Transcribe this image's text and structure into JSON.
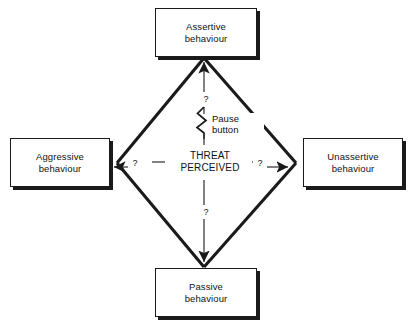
{
  "diagram": {
    "center": {
      "label": "THREAT\nPERCEIVED",
      "line1": "THREAT",
      "line2": "PERCEIVED"
    },
    "pause": {
      "label": "Pause\nbutton",
      "line1": "Pause",
      "line2": "button",
      "icon": "lightning-squiggle-icon"
    },
    "nodes": [
      {
        "id": "assertive",
        "label": "Assertive\nbehaviour",
        "line1": "Assertive",
        "line2": "behaviour",
        "position": "top"
      },
      {
        "id": "aggressive",
        "label": "Aggressive\nbehaviour",
        "line1": "Aggressive",
        "line2": "behaviour",
        "position": "left"
      },
      {
        "id": "unassertive",
        "label": "Unassertive\nbehaviour",
        "line1": "Unassertive",
        "line2": "behaviour",
        "position": "right"
      },
      {
        "id": "passive",
        "label": "Passive\nbehaviour",
        "line1": "Passive",
        "line2": "behaviour",
        "position": "bottom"
      }
    ],
    "uncertainty_markers": {
      "top": "?",
      "bottom": "?",
      "left": "?",
      "right": "?"
    },
    "colors": {
      "stroke": "#1a1a1a",
      "background": "#ffffff",
      "text": "#111111"
    }
  }
}
